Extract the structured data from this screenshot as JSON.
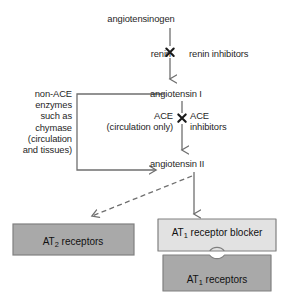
{
  "diagram": {
    "nodes": {
      "angiotensinogen": "angiotensinogen",
      "angiotensin_1": "angiotensin I",
      "angiotensin_2": "angiotensin II"
    },
    "steps": {
      "renin_enzyme": "renin",
      "renin_blocker": "renin inhibitors",
      "ace_enzyme_line1": "ACE",
      "ace_enzyme_line2": "(circulation only)",
      "ace_blocker_line1": "ACE",
      "ace_blocker_line2": "inhibitors"
    },
    "alternate_pathway": {
      "line1": "non-ACE",
      "line2": "enzymes",
      "line3": "such as",
      "line4": "chymase",
      "line5": "(circulation",
      "line6": "and tissues)"
    },
    "boxes": {
      "at2_receptors_prefix": "AT",
      "at2_receptors_sub": "2",
      "at2_receptors_suffix": " receptors",
      "at1_blocker_prefix": "AT",
      "at1_blocker_sub": "1",
      "at1_blocker_suffix": " receptor blocker",
      "at1_receptors_prefix": "AT",
      "at1_receptors_sub": "1",
      "at1_receptors_suffix": " receptors"
    },
    "symbols": {
      "block_marker": "✖",
      "arrow_solid": "solid-arrow-down",
      "arrow_dashed": "dashed-arrow-diagonal",
      "bracket": "left-bracket-connector"
    },
    "colors": {
      "stroke": "#6f6f6f",
      "text": "#1a1a1a",
      "box_dark_fill": "#a9a9a9",
      "box_light_fill": "#e2e2e2",
      "box_border": "#808080"
    }
  }
}
